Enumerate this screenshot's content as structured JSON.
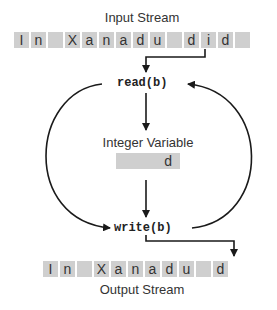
{
  "input_stream": {
    "label": "Input Stream",
    "cells": [
      "I",
      "n",
      "",
      "X",
      "a",
      "n",
      "a",
      "d",
      "u",
      "",
      "d",
      "i",
      "d",
      ""
    ]
  },
  "read_call": "read(b)",
  "integer_variable": {
    "label": "Integer Variable",
    "value": "d"
  },
  "write_call": "write(b)",
  "output_stream": {
    "label": "Output Stream",
    "cells": [
      "I",
      "n",
      "",
      "X",
      "a",
      "n",
      "a",
      "d",
      "u",
      "",
      "d"
    ]
  },
  "colors": {
    "cell_fill": "#cfcfcf",
    "stroke": "#1a1a1a"
  }
}
